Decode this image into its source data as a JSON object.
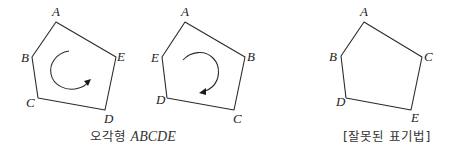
{
  "figures": [
    {
      "id": "pentagon-1",
      "vertices": [
        {
          "label": "A",
          "x": 56,
          "y": 22,
          "lx": 52,
          "ly": 16
        },
        {
          "label": "B",
          "x": 32,
          "y": 57,
          "lx": 21,
          "ly": 62
        },
        {
          "label": "C",
          "x": 38,
          "y": 98,
          "lx": 26,
          "ly": 107
        },
        {
          "label": "D",
          "x": 105,
          "y": 110,
          "lx": 104,
          "ly": 123
        },
        {
          "label": "E",
          "x": 116,
          "y": 57,
          "lx": 117,
          "ly": 61
        }
      ],
      "orientation_arrow": "counterclockwise"
    },
    {
      "id": "pentagon-2",
      "vertices": [
        {
          "label": "A",
          "x": 185,
          "y": 22,
          "lx": 181,
          "ly": 16
        },
        {
          "label": "E",
          "x": 162,
          "y": 57,
          "lx": 151,
          "ly": 62
        },
        {
          "label": "D",
          "x": 167,
          "y": 98,
          "lx": 156,
          "ly": 104
        },
        {
          "label": "C",
          "x": 234,
          "y": 110,
          "lx": 233,
          "ly": 123
        },
        {
          "label": "B",
          "x": 245,
          "y": 57,
          "lx": 247,
          "ly": 61
        }
      ],
      "orientation_arrow": "clockwise"
    },
    {
      "id": "pentagon-3",
      "vertices": [
        {
          "label": "A",
          "x": 364,
          "y": 22,
          "lx": 360,
          "ly": 16
        },
        {
          "label": "B",
          "x": 341,
          "y": 56,
          "lx": 329,
          "ly": 61
        },
        {
          "label": "D",
          "x": 346,
          "y": 98,
          "lx": 336,
          "ly": 106
        },
        {
          "label": "E",
          "x": 411,
          "y": 110,
          "lx": 411,
          "ly": 122
        },
        {
          "label": "C",
          "x": 422,
          "y": 57,
          "lx": 424,
          "ly": 61
        }
      ],
      "orientation_arrow": "none"
    }
  ],
  "captions": {
    "left": {
      "korean": "오각형",
      "math": "ABCDE"
    },
    "right": {
      "korean": "[잘못된 표기법]"
    }
  },
  "colors": {
    "stroke": "#2a2a2a",
    "text": "#333333",
    "background": "#ffffff"
  }
}
